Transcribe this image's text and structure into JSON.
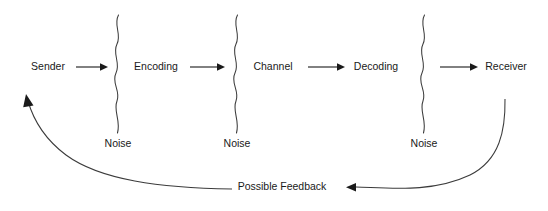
{
  "diagram": {
    "background_color": "#ffffff",
    "line_color": "#1a1a1a",
    "squiggle_color": "#3b3b3b",
    "text_color": "#1a1a1a",
    "stages": [
      {
        "label": "Sender",
        "x": 48,
        "y": 67
      },
      {
        "label": "Encoding",
        "x": 156,
        "y": 67
      },
      {
        "label": "Channel",
        "x": 273,
        "y": 67
      },
      {
        "label": "Decoding",
        "x": 376,
        "y": 67
      },
      {
        "label": "Receiver",
        "x": 506,
        "y": 67
      }
    ],
    "noise_barriers": [
      {
        "label": "Noise",
        "x": 118,
        "label_y": 144,
        "top": 15,
        "bottom": 133
      },
      {
        "label": "Noise",
        "x": 237,
        "label_y": 144,
        "top": 15,
        "bottom": 133
      },
      {
        "label": "Noise",
        "x": 424,
        "label_y": 144,
        "top": 15,
        "bottom": 133
      }
    ],
    "arrows": [
      {
        "name": "sender-to-encoding",
        "x1": 76,
        "x2": 106,
        "y": 67
      },
      {
        "name": "encoding-to-channel",
        "x1": 190,
        "x2": 224,
        "y": 67
      },
      {
        "name": "channel-to-decoding",
        "x1": 308,
        "x2": 344,
        "y": 67
      },
      {
        "name": "decoding-to-receiver",
        "x1": 440,
        "x2": 478,
        "y": 67
      }
    ],
    "feedback": {
      "label": "Possible Feedback",
      "label_x": 282,
      "label_y": 187,
      "right_curve_start_x": 505,
      "right_curve_start_y": 99,
      "right_arrow_tip_x": 348,
      "right_arrow_tip_y": 187,
      "left_curve_start_x": 232,
      "left_curve_start_y": 189,
      "left_arrow_tip_x": 26,
      "left_arrow_tip_y": 94
    }
  }
}
